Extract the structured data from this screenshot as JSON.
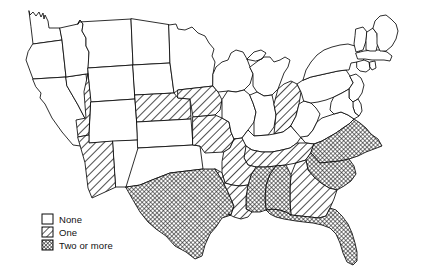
{
  "map": {
    "title": "United States choropleth map",
    "projection": "contiguous-united-states",
    "outline_color": "#0a0a0a",
    "background_color": "#ffffff"
  },
  "legend": {
    "name": "map-legend",
    "items": [
      {
        "label": "None",
        "pattern": "blank",
        "swatch_name": "legend-swatch-none"
      },
      {
        "label": "One",
        "pattern": "diagonal-hatch",
        "swatch_name": "legend-swatch-one"
      },
      {
        "label": "Two or more",
        "pattern": "cross-hatch",
        "swatch_name": "legend-swatch-two-or-more"
      }
    ]
  },
  "chart_data": {
    "type": "map",
    "title": "",
    "categories": [
      "None",
      "One",
      "Two or more"
    ],
    "category_patterns": [
      "blank",
      "diagonal-hatch",
      "cross-hatch"
    ],
    "category_counts": {
      "None": 32,
      "One": 10,
      "Two or more": 6
    },
    "regions": [
      {
        "code": "WA",
        "name": "Washington",
        "category": "None",
        "value": 0
      },
      {
        "code": "OR",
        "name": "Oregon",
        "category": "None",
        "value": 0
      },
      {
        "code": "CA",
        "name": "California",
        "category": "None",
        "value": 0
      },
      {
        "code": "NV",
        "name": "Nevada",
        "category": "None",
        "value": 0
      },
      {
        "code": "ID",
        "name": "Idaho",
        "category": "None",
        "value": 0
      },
      {
        "code": "MT",
        "name": "Montana",
        "category": "None",
        "value": 0
      },
      {
        "code": "WY",
        "name": "Wyoming",
        "category": "None",
        "value": 0
      },
      {
        "code": "UT",
        "name": "Utah",
        "category": "One",
        "value": 1
      },
      {
        "code": "AZ",
        "name": "Arizona",
        "category": "One",
        "value": 1
      },
      {
        "code": "CO",
        "name": "Colorado",
        "category": "None",
        "value": 0
      },
      {
        "code": "NM",
        "name": "New Mexico",
        "category": "None",
        "value": 0
      },
      {
        "code": "ND",
        "name": "North Dakota",
        "category": "None",
        "value": 0
      },
      {
        "code": "SD",
        "name": "South Dakota",
        "category": "None",
        "value": 0
      },
      {
        "code": "NE",
        "name": "Nebraska",
        "category": "One",
        "value": 1
      },
      {
        "code": "KS",
        "name": "Kansas",
        "category": "None",
        "value": 0
      },
      {
        "code": "OK",
        "name": "Oklahoma",
        "category": "None",
        "value": 0
      },
      {
        "code": "TX",
        "name": "Texas",
        "category": "Two or more",
        "value": 2
      },
      {
        "code": "MN",
        "name": "Minnesota",
        "category": "None",
        "value": 0
      },
      {
        "code": "IA",
        "name": "Iowa",
        "category": "One",
        "value": 1
      },
      {
        "code": "MO",
        "name": "Missouri",
        "category": "One",
        "value": 1
      },
      {
        "code": "AR",
        "name": "Arkansas",
        "category": "One",
        "value": 1
      },
      {
        "code": "LA",
        "name": "Louisiana",
        "category": "One",
        "value": 1
      },
      {
        "code": "WI",
        "name": "Wisconsin",
        "category": "None",
        "value": 0
      },
      {
        "code": "IL",
        "name": "Illinois",
        "category": "None",
        "value": 0
      },
      {
        "code": "MI",
        "name": "Michigan",
        "category": "None",
        "value": 0
      },
      {
        "code": "IN",
        "name": "Indiana",
        "category": "None",
        "value": 0
      },
      {
        "code": "OH",
        "name": "Ohio",
        "category": "One",
        "value": 1
      },
      {
        "code": "KY",
        "name": "Kentucky",
        "category": "None",
        "value": 0
      },
      {
        "code": "TN",
        "name": "Tennessee",
        "category": "One",
        "value": 1
      },
      {
        "code": "MS",
        "name": "Mississippi",
        "category": "Two or more",
        "value": 2
      },
      {
        "code": "AL",
        "name": "Alabama",
        "category": "Two or more",
        "value": 2
      },
      {
        "code": "GA",
        "name": "Georgia",
        "category": "One",
        "value": 1
      },
      {
        "code": "FL",
        "name": "Florida",
        "category": "Two or more",
        "value": 2
      },
      {
        "code": "SC",
        "name": "South Carolina",
        "category": "Two or more",
        "value": 2
      },
      {
        "code": "NC",
        "name": "North Carolina",
        "category": "Two or more",
        "value": 2
      },
      {
        "code": "VA",
        "name": "Virginia",
        "category": "None",
        "value": 0
      },
      {
        "code": "WV",
        "name": "West Virginia",
        "category": "None",
        "value": 0
      },
      {
        "code": "MD",
        "name": "Maryland",
        "category": "None",
        "value": 0
      },
      {
        "code": "DE",
        "name": "Delaware",
        "category": "None",
        "value": 0
      },
      {
        "code": "PA",
        "name": "Pennsylvania",
        "category": "None",
        "value": 0
      },
      {
        "code": "NJ",
        "name": "New Jersey",
        "category": "None",
        "value": 0
      },
      {
        "code": "NY",
        "name": "New York",
        "category": "None",
        "value": 0
      },
      {
        "code": "CT",
        "name": "Connecticut",
        "category": "None",
        "value": 0
      },
      {
        "code": "RI",
        "name": "Rhode Island",
        "category": "None",
        "value": 0
      },
      {
        "code": "MA",
        "name": "Massachusetts",
        "category": "None",
        "value": 0
      },
      {
        "code": "VT",
        "name": "Vermont",
        "category": "None",
        "value": 0
      },
      {
        "code": "NH",
        "name": "New Hampshire",
        "category": "None",
        "value": 0
      },
      {
        "code": "ME",
        "name": "Maine",
        "category": "None",
        "value": 0
      }
    ]
  }
}
